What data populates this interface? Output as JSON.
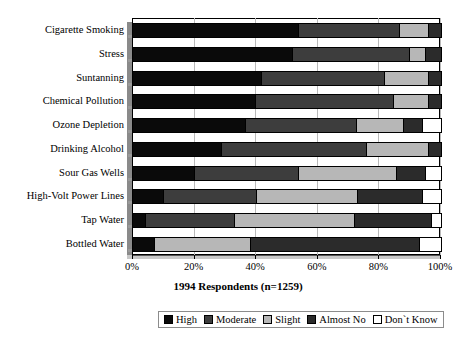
{
  "chart_data": {
    "type": "bar",
    "orientation": "horizontal",
    "stacked": true,
    "percent": true,
    "title": "",
    "xlabel": "1994 Respondents (n=1259)",
    "ylabel": "",
    "xlim": [
      0,
      100
    ],
    "xticks": [
      "0%",
      "20%",
      "40%",
      "60%",
      "80%",
      "100%"
    ],
    "xtick_values": [
      0,
      20,
      40,
      60,
      80,
      100
    ],
    "grid": true,
    "legend_position": "bottom",
    "categories": [
      "Cigarette Smoking",
      "Stress",
      "Suntanning",
      "Chemical Pollution",
      "Ozone Depletion",
      "Drinking Alcohol",
      "Sour Gas Wells",
      "High-Volt Power Lines",
      "Tap Water",
      "Bottled Water"
    ],
    "series": [
      {
        "name": "High",
        "color": "#0a0a0a",
        "values": [
          54,
          52,
          42,
          40,
          37,
          29,
          20,
          10,
          4,
          7
        ]
      },
      {
        "name": "Moderate",
        "color": "#3d3d3d",
        "values": [
          33,
          38,
          40,
          45,
          36,
          47,
          34,
          30,
          29,
          0
        ]
      },
      {
        "name": "Slight",
        "color": "#b7b7b7",
        "values": [
          9,
          5,
          14,
          11,
          15,
          20,
          32,
          33,
          39,
          31
        ]
      },
      {
        "name": "Almost No",
        "color": "#2b2b2b",
        "values": [
          4,
          5,
          4,
          4,
          6,
          4,
          9,
          21,
          25,
          55
        ]
      },
      {
        "name": "Don't Know",
        "color": "#ffffff",
        "values": [
          0,
          0,
          0,
          0,
          6,
          0,
          5,
          6,
          3,
          7
        ]
      }
    ]
  },
  "legend": {
    "items": [
      {
        "label": "High",
        "swatch": "sw-high"
      },
      {
        "label": "Moderate",
        "swatch": "sw-moderate"
      },
      {
        "label": "Slight",
        "swatch": "sw-slight"
      },
      {
        "label": "Almost No",
        "swatch": "sw-almost"
      },
      {
        "label": "Don`t Know",
        "swatch": "sw-dontknow"
      }
    ]
  },
  "axis": {
    "x_title": "1994 Respondents (n=1259)"
  }
}
